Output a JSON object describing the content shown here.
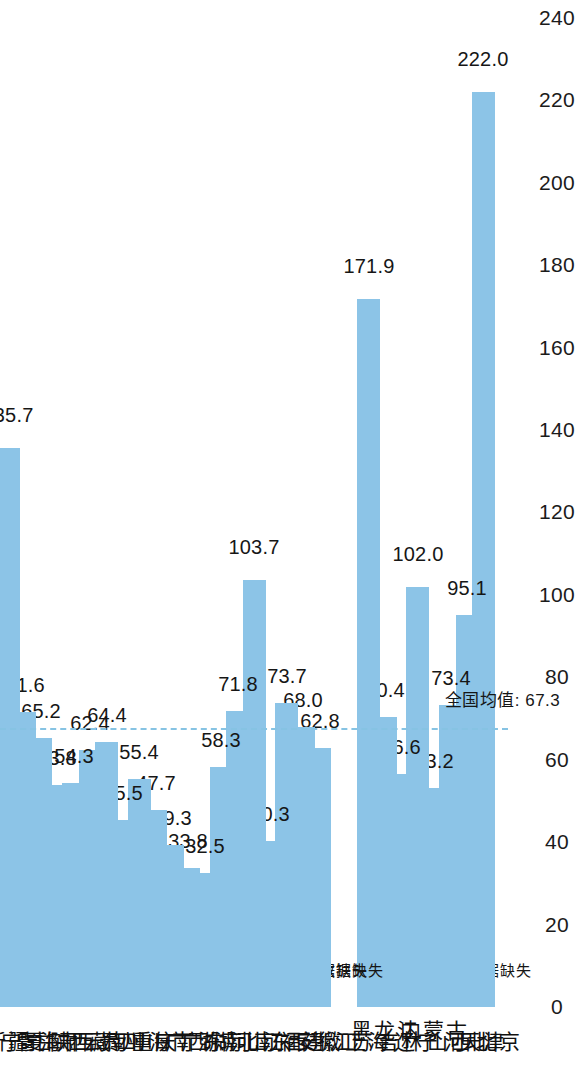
{
  "chart_data": {
    "type": "bar",
    "orientation": "horizontal",
    "title": "",
    "xlabel": "",
    "ylabel": "",
    "xlim": [
      0,
      240
    ],
    "xticks": [
      0,
      20,
      40,
      60,
      80,
      100,
      120,
      140,
      160,
      180,
      200,
      220,
      240
    ],
    "grid": false,
    "legend": null,
    "bar_color": "#8cc4e7",
    "missing_label": "数据缺失",
    "reference_line": {
      "label": "全国均值: 67.3",
      "value": 67.3,
      "color": "#86c3e3",
      "style": "dashed"
    },
    "categories": [
      "北京",
      "天津",
      "河北",
      "山西",
      "内蒙古",
      "辽宁",
      "吉林",
      "黑龙江",
      "上海",
      "江苏",
      "浙江",
      "安徽",
      "福建",
      "江西",
      "山东",
      "河南",
      "湖北",
      "湖南",
      "广东",
      "广西",
      "海南",
      "重庆",
      "四川",
      "贵州",
      "云南",
      "西藏",
      "陕西",
      "甘肃",
      "青海",
      "宁夏",
      "新疆"
    ],
    "values": [
      null,
      222.0,
      95.1,
      73.4,
      53.2,
      102.0,
      56.6,
      70.4,
      171.9,
      null,
      null,
      62.8,
      68.0,
      73.7,
      40.3,
      103.7,
      71.8,
      58.3,
      32.5,
      33.8,
      39.3,
      47.7,
      55.4,
      45.5,
      64.4,
      62.4,
      54.3,
      53.8,
      65.2,
      71.6,
      135.7
    ],
    "value_labels": [
      "数据缺失",
      "222.0",
      "95.1",
      "73.4",
      "53.2",
      "102.0",
      "56.6",
      "70.4",
      "171.9",
      "数据缺失",
      "数据缺失",
      "62.8",
      "68.0",
      "73.7",
      "40.3",
      "103.7",
      "71.8",
      "58.3",
      "32.5",
      "33.8",
      "39.3",
      "47.7",
      "55.4",
      "45.5",
      "64.4",
      "62.4",
      "54.3",
      "53.8",
      "65.2",
      "71.6",
      "135.7"
    ]
  }
}
